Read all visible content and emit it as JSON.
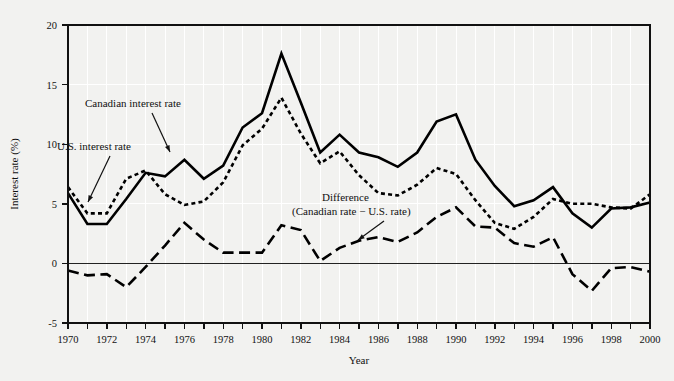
{
  "chart_data": {
    "type": "line",
    "title": "",
    "xlabel": "Year",
    "ylabel": "Interest rate (%)",
    "xlim": [
      1970,
      2000
    ],
    "ylim": [
      -5,
      20
    ],
    "ytick_labels": [
      "20",
      "15",
      "10",
      "5",
      "0",
      "-5"
    ],
    "yticks": [
      20,
      15,
      10,
      5,
      0,
      -5
    ],
    "xtick_labels": [
      "1970",
      "1972",
      "1974",
      "1976",
      "1978",
      "1980",
      "1982",
      "1984",
      "1986",
      "1988",
      "1990",
      "1992",
      "1994",
      "1996",
      "1998",
      "2000"
    ],
    "xticks_major": [
      1970,
      1972,
      1974,
      1976,
      1978,
      1980,
      1982,
      1984,
      1986,
      1988,
      1990,
      1992,
      1994,
      1996,
      1998,
      2000
    ],
    "xticks_minor": [
      1971,
      1973,
      1975,
      1977,
      1979,
      1981,
      1983,
      1985,
      1987,
      1989,
      1991,
      1993,
      1995,
      1997,
      1999
    ],
    "grid": true,
    "grid_color": "#ffffff",
    "plot_bg": "#f2f2f0",
    "legend_position": "inline-annotations",
    "x": [
      1970,
      1971,
      1972,
      1973,
      1974,
      1975,
      1976,
      1977,
      1978,
      1979,
      1980,
      1981,
      1982,
      1983,
      1984,
      1985,
      1986,
      1987,
      1988,
      1989,
      1990,
      1991,
      1992,
      1993,
      1994,
      1995,
      1996,
      1997,
      1998,
      1999,
      2000
    ],
    "series": [
      {
        "name": "Canadian interest rate",
        "style": "solid",
        "color": "#000000",
        "values": [
          5.9,
          3.3,
          3.3,
          5.4,
          7.6,
          7.3,
          8.7,
          7.1,
          8.2,
          11.4,
          12.6,
          17.6,
          13.5,
          9.3,
          10.8,
          9.3,
          8.9,
          8.1,
          9.3,
          11.9,
          12.5,
          8.7,
          6.5,
          4.8,
          5.3,
          6.4,
          4.2,
          3.0,
          4.6,
          4.7,
          5.1
        ]
      },
      {
        "name": "U.S. interest rate",
        "style": "dotted",
        "color": "#000000",
        "values": [
          6.4,
          4.2,
          4.2,
          7.1,
          7.8,
          5.8,
          4.9,
          5.2,
          6.8,
          9.9,
          11.3,
          13.9,
          10.9,
          8.4,
          9.4,
          7.4,
          5.9,
          5.7,
          6.6,
          8.0,
          7.5,
          5.3,
          3.4,
          2.9,
          3.9,
          5.4,
          5.0,
          5.0,
          4.7,
          4.6,
          5.8
        ]
      },
      {
        "name": "Difference (Canadian rate − U.S. rate)",
        "style": "dashed",
        "color": "#000000",
        "values": [
          -0.6,
          -1.0,
          -0.9,
          -2.0,
          -0.3,
          1.5,
          3.4,
          2.0,
          0.9,
          0.9,
          0.9,
          3.2,
          2.8,
          0.2,
          1.3,
          1.9,
          2.2,
          1.8,
          2.6,
          3.9,
          4.7,
          3.1,
          3.0,
          1.7,
          1.4,
          2.2,
          -0.9,
          -2.3,
          -0.4,
          -0.3,
          -0.7
        ]
      }
    ],
    "annotations": [
      {
        "name": "canadian-rate-label",
        "text": "Canadian interest rate",
        "x_px": 85,
        "y_px": 107,
        "arrow_from": [
          152,
          113
        ],
        "arrow_to": [
          170,
          152
        ]
      },
      {
        "name": "us-rate-label",
        "text": "U.S. interest rate",
        "x_px": 57,
        "y_px": 150,
        "arrow_from": [
          110,
          156
        ],
        "arrow_to": [
          88,
          202
        ]
      },
      {
        "name": "difference-label-line1",
        "text": "Difference",
        "x_px": 322,
        "y_px": 201
      },
      {
        "name": "difference-label-line2",
        "text": "(Canadian rate − U.S. rate)",
        "x_px": 292,
        "y_px": 215,
        "arrow_from": [
          384,
          221
        ],
        "arrow_to": [
          358,
          240
        ]
      }
    ]
  }
}
